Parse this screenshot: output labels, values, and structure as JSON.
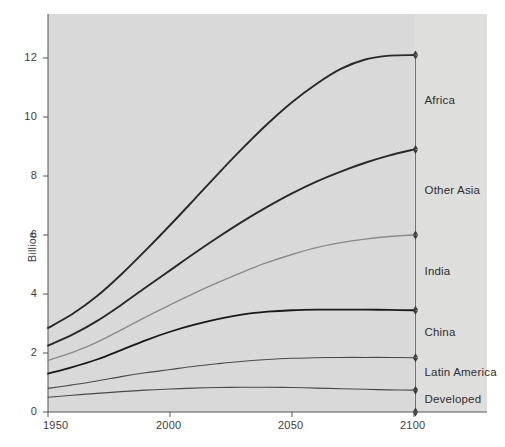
{
  "chart_data": {
    "type": "line",
    "title": "",
    "subtitle": "",
    "xlabel": "",
    "ylabel": "Billion",
    "xlim": [
      1950,
      2100
    ],
    "ylim": [
      0,
      13.5
    ],
    "xticks": [
      1950,
      2000,
      2050,
      2100
    ],
    "xticklabels": [
      "1950",
      "2000",
      "2050",
      "2100"
    ],
    "yticks": [
      0,
      2,
      4,
      6,
      8,
      10,
      12
    ],
    "yticklabels": [
      "0",
      "2",
      "4",
      "6",
      "8",
      "10",
      "12"
    ],
    "grid": false,
    "legend_position": "right-inline-band-labels",
    "note": "Cumulative stacked population projections; each curve is a running total, band between adjacent curves is the region named at right.",
    "x": [
      1950,
      1960,
      1970,
      1980,
      1990,
      2000,
      2010,
      2020,
      2030,
      2040,
      2050,
      2060,
      2070,
      2080,
      2090,
      2100
    ],
    "series": [
      {
        "name": "Developed",
        "color": "#4a4a4a",
        "width": 1.1,
        "values": [
          0.5,
          0.57,
          0.63,
          0.69,
          0.74,
          0.78,
          0.81,
          0.83,
          0.84,
          0.84,
          0.83,
          0.81,
          0.79,
          0.77,
          0.75,
          0.74
        ]
      },
      {
        "name": "Latin America",
        "color": "#4a4a4a",
        "width": 1.1,
        "values": [
          0.8,
          0.92,
          1.05,
          1.2,
          1.33,
          1.44,
          1.55,
          1.64,
          1.72,
          1.78,
          1.82,
          1.84,
          1.85,
          1.85,
          1.85,
          1.84
        ]
      },
      {
        "name": "China",
        "color": "#1a1a1a",
        "width": 1.8,
        "values": [
          1.3,
          1.52,
          1.78,
          2.1,
          2.43,
          2.72,
          2.96,
          3.16,
          3.31,
          3.4,
          3.45,
          3.47,
          3.47,
          3.47,
          3.46,
          3.45
        ]
      },
      {
        "name": "India",
        "color": "#8a8a8a",
        "width": 1.4,
        "values": [
          1.75,
          2.02,
          2.36,
          2.78,
          3.22,
          3.63,
          4.03,
          4.4,
          4.75,
          5.07,
          5.34,
          5.57,
          5.74,
          5.86,
          5.95,
          6.0
        ]
      },
      {
        "name": "Other Asia",
        "color": "#2a2a2a",
        "width": 1.9,
        "values": [
          2.25,
          2.62,
          3.08,
          3.63,
          4.22,
          4.8,
          5.38,
          5.94,
          6.47,
          6.96,
          7.41,
          7.81,
          8.15,
          8.45,
          8.7,
          8.9
        ]
      },
      {
        "name": "Africa",
        "color": "#2a2a2a",
        "width": 1.9,
        "values": [
          2.85,
          3.32,
          3.92,
          4.66,
          5.48,
          6.33,
          7.21,
          8.1,
          8.96,
          9.77,
          10.5,
          11.12,
          11.63,
          11.95,
          12.08,
          12.1
        ]
      }
    ],
    "band_labels": [
      {
        "name": "Africa",
        "top": 12.1,
        "bottom": 8.9,
        "label_value": 10.5
      },
      {
        "name": "Other Asia",
        "top": 8.9,
        "bottom": 6.0,
        "label_value": 7.45
      },
      {
        "name": "India",
        "top": 6.0,
        "bottom": 3.45,
        "label_value": 4.72
      },
      {
        "name": "China",
        "top": 3.45,
        "bottom": 1.84,
        "label_value": 2.65
      },
      {
        "name": "Latin America",
        "top": 1.84,
        "bottom": 0.74,
        "label_value": 1.29
      },
      {
        "name": "Developed",
        "top": 0.74,
        "bottom": 0.0,
        "label_value": 0.37
      }
    ]
  },
  "axes": {
    "y_title": "Billion"
  }
}
